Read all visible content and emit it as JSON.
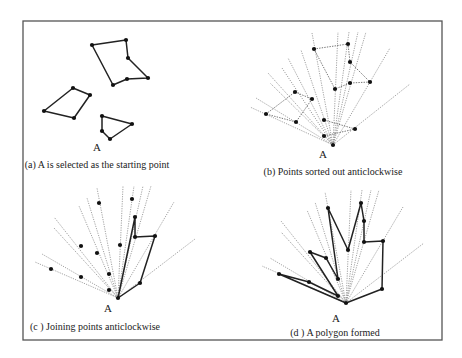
{
  "figure": {
    "frame": {
      "x": 23,
      "y": 21,
      "width": 419,
      "height": 319,
      "color": "#555555"
    },
    "panels": [
      {
        "id": "a",
        "caption": "(a) A is selected as the starting point",
        "caption_pos": [
          97,
          159
        ],
        "a_label": "A",
        "a_label_pos": [
          97,
          141
        ],
        "origin": [
          97,
          145
        ],
        "points": [
          [
            92,
            45
          ],
          [
            126,
            40
          ],
          [
            128,
            58
          ],
          [
            148,
            78
          ],
          [
            127,
            79
          ],
          [
            113,
            85
          ],
          [
            44,
            111
          ],
          [
            73,
            88
          ],
          [
            90,
            95
          ],
          [
            74,
            118
          ],
          [
            102,
            116
          ],
          [
            132,
            124
          ],
          [
            110,
            139
          ],
          [
            102,
            131
          ]
        ],
        "rays": [],
        "dotted_edges": [],
        "solid_paths": [
          [
            [
              92,
              45
            ],
            [
              126,
              40
            ],
            [
              128,
              58
            ],
            [
              148,
              78
            ],
            [
              127,
              79
            ],
            [
              113,
              85
            ],
            [
              92,
              45
            ]
          ],
          [
            [
              44,
              111
            ],
            [
              73,
              88
            ],
            [
              90,
              95
            ],
            [
              74,
              118
            ],
            [
              44,
              111
            ]
          ],
          [
            [
              102,
              116
            ],
            [
              132,
              124
            ],
            [
              110,
              139
            ],
            [
              102,
              131
            ],
            [
              102,
              116
            ]
          ]
        ]
      },
      {
        "id": "b",
        "caption": "(b) Points sorted out anticlockwise",
        "caption_pos": [
          333,
          166
        ],
        "a_label": "A",
        "a_label_pos": [
          323,
          148
        ],
        "origin": [
          333,
          145
        ],
        "points": [
          [
            314,
            49
          ],
          [
            348,
            44
          ],
          [
            350,
            62
          ],
          [
            370,
            82
          ],
          [
            350,
            83
          ],
          [
            335,
            89
          ],
          [
            266,
            114
          ],
          [
            295,
            92
          ],
          [
            312,
            99
          ],
          [
            296,
            122
          ],
          [
            324,
            120
          ],
          [
            355,
            129
          ],
          [
            324,
            136
          ],
          [
            333,
            145
          ]
        ],
        "rays": [
          [
            250,
            107
          ],
          [
            256,
            98
          ],
          [
            268,
            73
          ],
          [
            270,
            83
          ],
          [
            282,
            68
          ],
          [
            288,
            58
          ],
          [
            301,
            50
          ],
          [
            312,
            33
          ],
          [
            338,
            32
          ],
          [
            349,
            32
          ],
          [
            358,
            32
          ],
          [
            366,
            32
          ],
          [
            390,
            48
          ],
          [
            410,
            84
          ]
        ],
        "dotted_edges": [
          [
            [
              314,
              49
            ],
            [
              348,
              44
            ],
            [
              350,
              62
            ],
            [
              370,
              82
            ],
            [
              350,
              83
            ],
            [
              335,
              89
            ],
            [
              314,
              49
            ]
          ],
          [
            [
              266,
              114
            ],
            [
              295,
              92
            ],
            [
              312,
              99
            ],
            [
              296,
              122
            ],
            [
              266,
              114
            ]
          ],
          [
            [
              324,
              120
            ],
            [
              355,
              129
            ],
            [
              324,
              136
            ]
          ]
        ],
        "solid_paths": []
      },
      {
        "id": "c",
        "caption": "(c ) Joining  points anticlockwise",
        "caption_pos": [
          95,
          321
        ],
        "a_label": "A",
        "a_label_pos": [
          108,
          302
        ],
        "origin": [
          118,
          298
        ],
        "points": [
          [
            99,
            203
          ],
          [
            132,
            199
          ],
          [
            135,
            217
          ],
          [
            155,
            236
          ],
          [
            135,
            237
          ],
          [
            120,
            245
          ],
          [
            51,
            269
          ],
          [
            81,
            246
          ],
          [
            97,
            253
          ],
          [
            81,
            277
          ],
          [
            109,
            274
          ],
          [
            140,
            283
          ],
          [
            109,
            290
          ],
          [
            118,
            298
          ]
        ],
        "rays": [
          [
            35,
            262
          ],
          [
            42,
            254
          ],
          [
            54,
            217
          ],
          [
            54,
            228
          ],
          [
            79,
            206
          ],
          [
            87,
            198
          ],
          [
            97,
            188
          ],
          [
            123,
            186
          ],
          [
            134,
            186
          ],
          [
            143,
            186
          ],
          [
            151,
            186
          ],
          [
            174,
            202
          ],
          [
            195,
            239
          ]
        ],
        "dotted_edges": [],
        "solid_paths": [
          [
            [
              118,
              298
            ],
            [
              140,
              283
            ],
            [
              155,
              236
            ],
            [
              135,
              237
            ],
            [
              135,
              217
            ],
            [
              118,
              298
            ]
          ]
        ]
      },
      {
        "id": "d",
        "caption": "(d ) A polygon formed",
        "caption_pos": [
          335,
          327
        ],
        "a_label": "A",
        "a_label_pos": [
          336,
          312
        ],
        "origin": [
          346,
          303
        ],
        "points": [
          [
            328,
            208
          ],
          [
            361,
            203
          ],
          [
            364,
            221
          ],
          [
            383,
            241
          ],
          [
            364,
            242
          ],
          [
            348,
            250
          ],
          [
            279,
            274
          ],
          [
            310,
            252
          ],
          [
            326,
            258
          ],
          [
            309,
            282
          ],
          [
            338,
            279
          ],
          [
            382,
            289
          ],
          [
            338,
            296
          ],
          [
            346,
            303
          ]
        ],
        "rays": [
          [
            262,
            266
          ],
          [
            270,
            258
          ],
          [
            281,
            221
          ],
          [
            281,
            232
          ],
          [
            307,
            210
          ],
          [
            315,
            202
          ],
          [
            325,
            192
          ],
          [
            351,
            190
          ],
          [
            362,
            190
          ],
          [
            371,
            190
          ],
          [
            379,
            190
          ],
          [
            403,
            207
          ],
          [
            424,
            243
          ]
        ],
        "dotted_edges": [],
        "solid_paths": [
          [
            [
              346,
              303
            ],
            [
              382,
              289
            ],
            [
              383,
              241
            ],
            [
              364,
              242
            ],
            [
              364,
              221
            ],
            [
              361,
              203
            ],
            [
              348,
              250
            ],
            [
              328,
              208
            ],
            [
              338,
              279
            ],
            [
              326,
              258
            ],
            [
              310,
              252
            ],
            [
              338,
              296
            ],
            [
              309,
              282
            ],
            [
              279,
              274
            ],
            [
              346,
              303
            ]
          ]
        ]
      }
    ]
  }
}
